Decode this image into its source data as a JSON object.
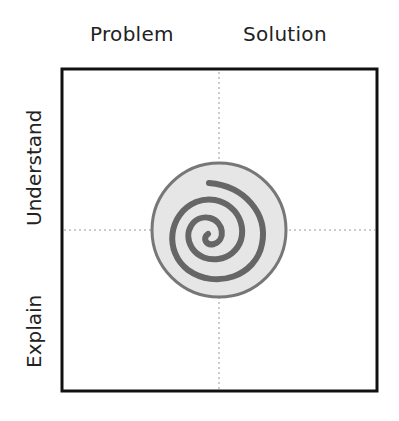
{
  "columns": {
    "left": "Problem",
    "right": "Solution"
  },
  "rows": {
    "top": "Understand",
    "bottom": "Explain"
  },
  "center_icon": "spiral-icon",
  "colors": {
    "frame": "#111111",
    "divider": "#999999",
    "circle_fill": "#e6e6e6",
    "circle_stroke": "#777777",
    "spiral": "#666666"
  }
}
